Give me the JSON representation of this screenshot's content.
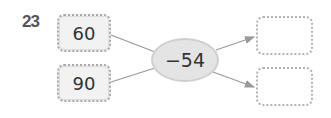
{
  "problem_number": "23",
  "inputs": [
    {
      "value": "60"
    },
    {
      "value": "90"
    }
  ],
  "operation": "−54",
  "outputs": [
    {
      "value": ""
    },
    {
      "value": ""
    }
  ],
  "colors": {
    "box_fill": "#f2f2f2",
    "oval_fill": "#e4e4e4",
    "line": "#999999"
  }
}
